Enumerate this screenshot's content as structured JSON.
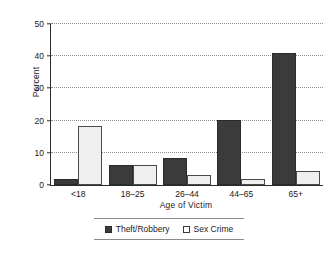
{
  "chart_data": {
    "type": "bar",
    "title": "",
    "xlabel": "Age of Victim",
    "ylabel": "Percent",
    "categories": [
      "<18",
      "18–25",
      "26–44",
      "44–65",
      "65+"
    ],
    "series": [
      {
        "name": "Theft/Robbery",
        "color": "#3b3b3b",
        "values": [
          1.9,
          6.3,
          8.3,
          20.2,
          41.1
        ]
      },
      {
        "name": "Sex Crime",
        "color": "#efefef",
        "values": [
          18.3,
          6.3,
          3.2,
          2.0,
          4.3
        ]
      }
    ],
    "ylim": [
      0,
      50
    ],
    "yticks": [
      0,
      10,
      20,
      30,
      40,
      50
    ],
    "ytick_labels": [
      "0",
      "10",
      "20",
      "30",
      "40",
      "50"
    ],
    "grid": "horizontal-dotted",
    "legend_position": "bottom-center"
  },
  "legend": {
    "items": [
      {
        "label": "Theft/Robbery",
        "swatch": "filled-dark-square"
      },
      {
        "label": "Sex Crime",
        "swatch": "outlined-white-square"
      }
    ]
  }
}
